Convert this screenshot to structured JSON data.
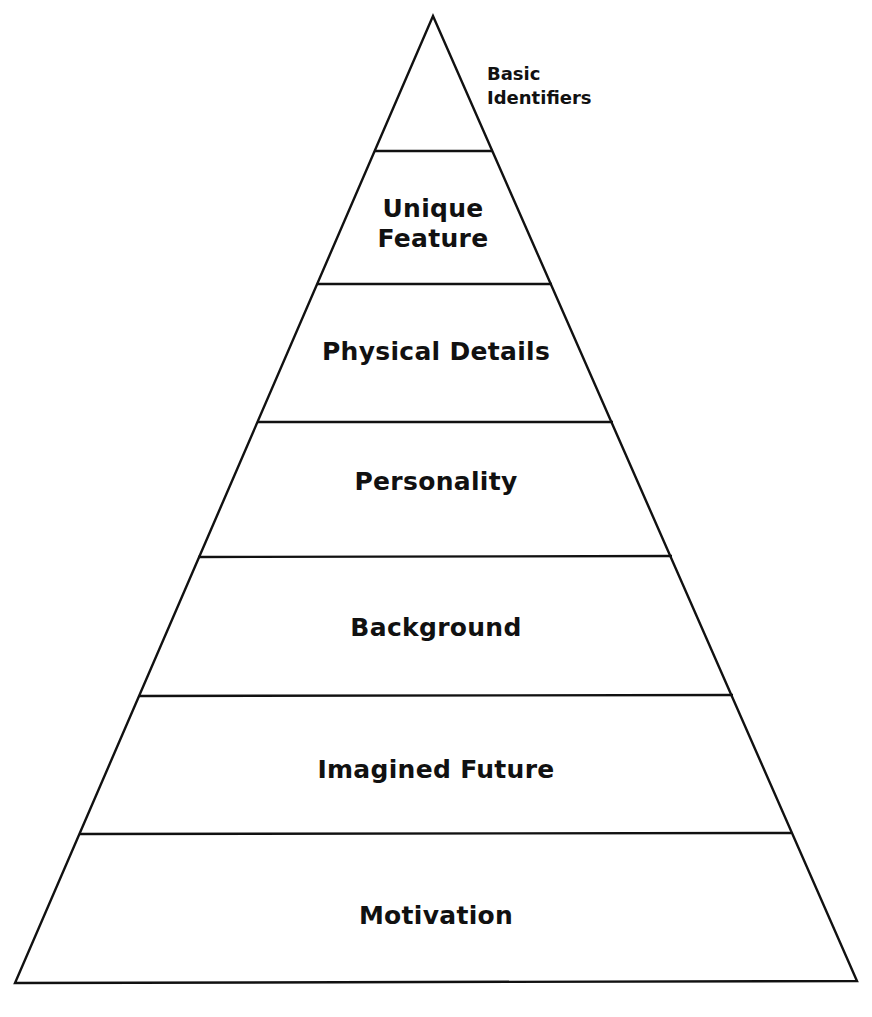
{
  "diagram": {
    "apex_label": {
      "lines": [
        "Basic",
        "Identifiers"
      ]
    },
    "levels": [
      {
        "lines": [
          "Unique",
          "Feature"
        ]
      },
      {
        "lines": [
          "Physical Details"
        ]
      },
      {
        "lines": [
          "Personality"
        ]
      },
      {
        "lines": [
          "Background"
        ]
      },
      {
        "lines": [
          "Imagined Future"
        ]
      },
      {
        "lines": [
          "Motivation"
        ]
      }
    ],
    "colors": {
      "stroke": "#111111",
      "fill": "#ffffff",
      "text": "#111111"
    }
  }
}
